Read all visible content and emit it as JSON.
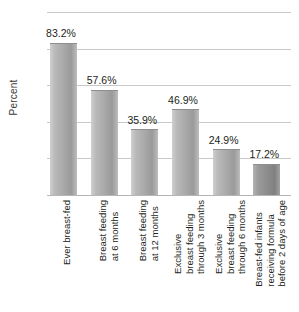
{
  "chart_data": {
    "type": "bar",
    "title": "",
    "xlabel": "",
    "ylabel": "Percent",
    "ylim": [
      0,
      100
    ],
    "yticks": [
      0,
      20,
      40,
      60,
      80,
      100
    ],
    "ytick_labels": [
      "0",
      "20",
      "40",
      "60",
      "80",
      "100"
    ],
    "grid": true,
    "legend": "none",
    "categories": [
      "Ever breast-fed",
      "Breast feeding at 6 months",
      "Breast feeding at 12 months",
      "Exclusive breast feeding through 3 months",
      "Exclusive breast feeding through 6 months",
      "Breast-fed infants receiving formula before 2 days of age"
    ],
    "category_lines": [
      [
        "Ever breast-fed"
      ],
      [
        "Breast feeding",
        "at 6 months"
      ],
      [
        "Breast feeding",
        "at 12 months"
      ],
      [
        "Exclusive",
        "breast feeding",
        "through 3 months"
      ],
      [
        "Exclusive",
        "breast feeding",
        "through 6 months"
      ],
      [
        "Breast-fed infants",
        "receiving formula",
        "before 2 days of age"
      ]
    ],
    "values": [
      83.2,
      57.6,
      35.9,
      46.9,
      24.9,
      17.2
    ],
    "value_labels": [
      "83.2%",
      "57.6%",
      "35.9%",
      "46.9%",
      "24.9%",
      "17.2%"
    ],
    "bar_colors": [
      "#aaaaaa",
      "#aaaaaa",
      "#aaaaaa",
      "#aaaaaa",
      "#aaaaaa",
      "#8d8d8d"
    ],
    "gridline_color": "#c9c9c9",
    "text_color": "#231f20",
    "background": "#ffffff"
  }
}
